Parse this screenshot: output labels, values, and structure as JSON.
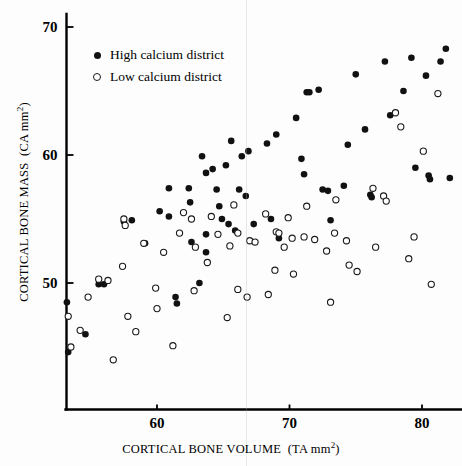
{
  "figure": {
    "background_color": "#fdfdfd",
    "marker_filled_color": "#111111",
    "marker_open_color": "#ffffff"
  },
  "axes": {
    "x": {
      "label_main": "CORTICAL BONE VOLUME",
      "label_units": "(TA mm",
      "label_exponent": "2",
      "label_close": ")",
      "ticks": [
        "60",
        "70",
        "80"
      ],
      "tick_values": [
        60,
        70,
        80
      ],
      "range": [
        53.0,
        83.0
      ]
    },
    "y": {
      "label_main": "CORTICAL BONE MASS",
      "label_units": "(CA mm",
      "label_exponent": "2",
      "label_close": ")",
      "ticks": [
        "50",
        "60",
        "70"
      ],
      "tick_values": [
        50,
        60,
        70
      ],
      "range": [
        43.0,
        70.8
      ]
    }
  },
  "legend": {
    "items": [
      {
        "marker": "filled-circle",
        "label": "High calcium district"
      },
      {
        "marker": "open-circle",
        "label": "Low calcium district"
      }
    ]
  },
  "chart_data": {
    "type": "scatter",
    "title": "",
    "xlabel": "CORTICAL BONE VOLUME (TA mm2)",
    "ylabel": "CORTICAL BONE MASS (CA mm2)",
    "xlim": [
      53.0,
      83.0
    ],
    "ylim": [
      43.0,
      70.8
    ],
    "xticks": [
      60,
      70,
      80
    ],
    "yticks": [
      50,
      60,
      70
    ],
    "grid": false,
    "legend_position": "upper-left-inside",
    "series": [
      {
        "name": "High calcium district",
        "marker": "filled-circle",
        "color": "#111111",
        "points": [
          [
            53.2,
            48.5
          ],
          [
            53.3,
            44.6
          ],
          [
            54.6,
            46.0
          ],
          [
            55.6,
            49.9
          ],
          [
            56.0,
            49.9
          ],
          [
            57.5,
            54.8
          ],
          [
            58.1,
            54.9
          ],
          [
            59.1,
            53.1
          ],
          [
            60.2,
            55.6
          ],
          [
            60.9,
            57.4
          ],
          [
            60.9,
            55.2
          ],
          [
            61.4,
            48.9
          ],
          [
            61.5,
            48.4
          ],
          [
            62.4,
            57.4
          ],
          [
            62.5,
            56.3
          ],
          [
            62.6,
            53.2
          ],
          [
            63.2,
            50.0
          ],
          [
            63.4,
            59.9
          ],
          [
            63.7,
            58.6
          ],
          [
            63.7,
            53.8
          ],
          [
            63.7,
            52.4
          ],
          [
            64.2,
            58.9
          ],
          [
            64.5,
            57.3
          ],
          [
            64.7,
            56.0
          ],
          [
            64.9,
            55.0
          ],
          [
            65.2,
            59.2
          ],
          [
            65.4,
            54.6
          ],
          [
            65.6,
            61.1
          ],
          [
            65.9,
            54.1
          ],
          [
            66.2,
            57.3
          ],
          [
            66.4,
            59.9
          ],
          [
            66.7,
            56.8
          ],
          [
            66.9,
            60.3
          ],
          [
            67.3,
            54.6
          ],
          [
            68.3,
            60.9
          ],
          [
            68.6,
            55.0
          ],
          [
            69.0,
            61.6
          ],
          [
            69.2,
            53.5
          ],
          [
            70.5,
            62.9
          ],
          [
            70.9,
            59.7
          ],
          [
            71.1,
            58.5
          ],
          [
            71.3,
            64.9
          ],
          [
            71.5,
            64.9
          ],
          [
            72.2,
            65.1
          ],
          [
            72.5,
            57.3
          ],
          [
            72.9,
            57.2
          ],
          [
            73.1,
            54.9
          ],
          [
            74.1,
            57.6
          ],
          [
            74.4,
            60.8
          ],
          [
            75.0,
            66.3
          ],
          [
            75.7,
            62.0
          ],
          [
            76.1,
            56.9
          ],
          [
            76.2,
            56.7
          ],
          [
            77.2,
            67.3
          ],
          [
            77.6,
            63.1
          ],
          [
            78.6,
            65.0
          ],
          [
            79.2,
            67.6
          ],
          [
            79.5,
            59.0
          ],
          [
            80.3,
            66.2
          ],
          [
            80.5,
            58.4
          ],
          [
            80.6,
            58.1
          ],
          [
            81.4,
            67.3
          ],
          [
            81.8,
            68.3
          ],
          [
            82.1,
            58.2
          ]
        ]
      },
      {
        "name": "Low calcium district",
        "marker": "open-circle",
        "color": "#ffffff",
        "points": [
          [
            53.3,
            47.4
          ],
          [
            53.5,
            45.0
          ],
          [
            54.2,
            46.3
          ],
          [
            54.8,
            48.9
          ],
          [
            55.6,
            50.3
          ],
          [
            56.3,
            50.2
          ],
          [
            56.7,
            44.0
          ],
          [
            57.4,
            51.3
          ],
          [
            57.5,
            55.0
          ],
          [
            57.6,
            54.5
          ],
          [
            57.8,
            47.4
          ],
          [
            58.4,
            46.2
          ],
          [
            59.0,
            53.1
          ],
          [
            59.9,
            49.6
          ],
          [
            60.0,
            48.0
          ],
          [
            60.5,
            52.4
          ],
          [
            61.2,
            45.1
          ],
          [
            61.7,
            53.9
          ],
          [
            62.0,
            55.5
          ],
          [
            62.6,
            55.0
          ],
          [
            62.8,
            49.4
          ],
          [
            62.9,
            52.8
          ],
          [
            63.8,
            51.6
          ],
          [
            64.1,
            55.2
          ],
          [
            64.6,
            53.8
          ],
          [
            65.3,
            47.3
          ],
          [
            65.5,
            52.9
          ],
          [
            65.8,
            56.1
          ],
          [
            66.1,
            53.9
          ],
          [
            66.1,
            49.5
          ],
          [
            66.8,
            48.9
          ],
          [
            67.0,
            53.3
          ],
          [
            67.4,
            53.2
          ],
          [
            68.2,
            55.4
          ],
          [
            68.4,
            49.1
          ],
          [
            68.9,
            51.0
          ],
          [
            69.0,
            54.0
          ],
          [
            69.2,
            53.9
          ],
          [
            69.6,
            52.8
          ],
          [
            69.9,
            55.1
          ],
          [
            70.2,
            53.5
          ],
          [
            70.3,
            50.7
          ],
          [
            71.1,
            53.6
          ],
          [
            71.3,
            56.0
          ],
          [
            71.9,
            53.4
          ],
          [
            72.8,
            52.5
          ],
          [
            73.1,
            48.5
          ],
          [
            73.4,
            53.9
          ],
          [
            73.5,
            56.5
          ],
          [
            74.3,
            53.3
          ],
          [
            74.5,
            51.4
          ],
          [
            75.1,
            50.9
          ],
          [
            76.3,
            57.4
          ],
          [
            76.5,
            52.8
          ],
          [
            77.1,
            56.8
          ],
          [
            77.3,
            56.4
          ],
          [
            78.0,
            63.3
          ],
          [
            78.4,
            62.2
          ],
          [
            79.0,
            51.9
          ],
          [
            79.4,
            53.6
          ],
          [
            80.1,
            60.3
          ],
          [
            80.7,
            49.9
          ],
          [
            81.2,
            64.8
          ]
        ]
      }
    ]
  }
}
